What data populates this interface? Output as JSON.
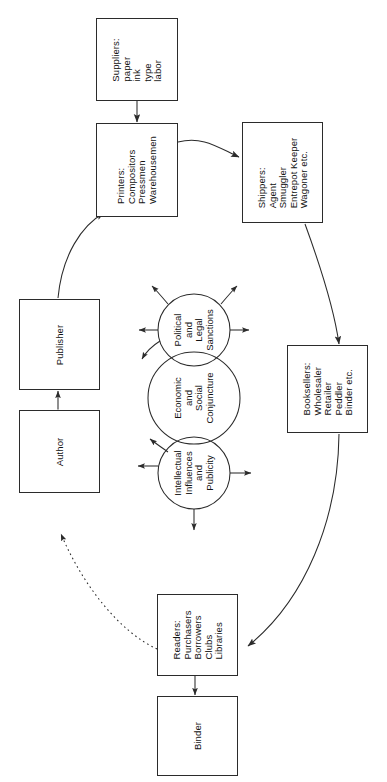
{
  "diagram": {
    "orientation": "rotated-90",
    "stroke_color": "#2b2b2b",
    "text_color": "#121212",
    "background": "#ffffff",
    "nodes": [
      {
        "id": "suppliers",
        "lines": [
          "Suppliers:",
          "paper",
          "ink",
          "type",
          "labor"
        ]
      },
      {
        "id": "printers",
        "lines": [
          "Printers:",
          "Compositors",
          "Pressmen",
          "Warehousemen"
        ]
      },
      {
        "id": "shippers",
        "lines": [
          "Shippers:",
          "Agent",
          "Smuggler",
          "Entrepot Keeper",
          "Wagoner etc."
        ]
      },
      {
        "id": "booksellers",
        "lines": [
          "Booksellers:",
          "Wholesaler",
          "Retailer",
          "Peddler",
          "Binder etc."
        ]
      },
      {
        "id": "readers",
        "lines": [
          "Readers:",
          "Purchasers",
          "Borrowers",
          "Clubs",
          "Libraries"
        ]
      },
      {
        "id": "binder",
        "lines": [
          "Binder"
        ]
      },
      {
        "id": "publisher",
        "lines": [
          "Publisher"
        ]
      },
      {
        "id": "author",
        "lines": [
          "Author"
        ]
      }
    ],
    "circles": [
      {
        "id": "political-legal",
        "lines": [
          "Political",
          "and",
          "Legal",
          "Sanctions"
        ]
      },
      {
        "id": "economic-social",
        "lines": [
          "Economic",
          "and",
          "Social",
          "Conjuncture"
        ]
      },
      {
        "id": "intellectual-publicity",
        "lines": [
          "Intellectual",
          "Influences",
          "and",
          "Publicity"
        ]
      }
    ],
    "edges": [
      {
        "id": "suppliers-to-printers",
        "from": "suppliers",
        "to": "printers",
        "style": "solid",
        "arrow": "single"
      },
      {
        "id": "printers-to-shippers",
        "from": "printers",
        "to": "shippers",
        "style": "solid",
        "arrow": "single"
      },
      {
        "id": "shippers-to-booksellers",
        "from": "shippers",
        "to": "booksellers",
        "style": "solid",
        "arrow": "single"
      },
      {
        "id": "booksellers-to-readers",
        "from": "booksellers",
        "to": "readers",
        "style": "solid",
        "arrow": "single"
      },
      {
        "id": "readers-to-binder",
        "from": "readers",
        "to": "binder",
        "style": "solid",
        "arrow": "double"
      },
      {
        "id": "readers-to-author",
        "from": "readers",
        "to": "author",
        "style": "dotted",
        "arrow": "single"
      },
      {
        "id": "author-to-publisher",
        "from": "author",
        "to": "publisher",
        "style": "solid",
        "arrow": "double"
      },
      {
        "id": "publisher-to-printers",
        "from": "publisher",
        "to": "printers",
        "style": "solid",
        "arrow": "single"
      }
    ]
  }
}
